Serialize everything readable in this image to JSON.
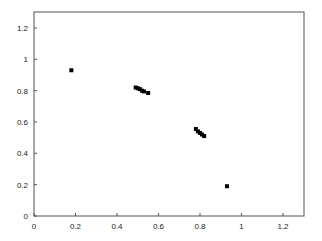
{
  "chart_data": {
    "type": "scatter",
    "title": "",
    "xlabel": "",
    "ylabel": "",
    "xlim": [
      0,
      1.3
    ],
    "ylim": [
      0,
      1.3
    ],
    "xticks": [
      0,
      0.2,
      0.4,
      0.6,
      0.8,
      1,
      1.2
    ],
    "yticks": [
      0,
      0.2,
      0.4,
      0.6,
      0.8,
      1,
      1.2
    ],
    "xtick_labels": [
      "0",
      "0.2",
      "0.4",
      "0.6",
      "0.8",
      "1",
      "1.2"
    ],
    "ytick_labels": [
      "0",
      "0.2",
      "0.4",
      "0.6",
      "0.8",
      "1",
      "1.2"
    ],
    "grid": false,
    "legend": null,
    "marker_color": "#000000",
    "series": [
      {
        "name": "points",
        "x": [
          0.18,
          0.49,
          0.5,
          0.51,
          0.52,
          0.53,
          0.55,
          0.78,
          0.79,
          0.8,
          0.81,
          0.82,
          0.93
        ],
        "y": [
          0.93,
          0.82,
          0.815,
          0.81,
          0.8,
          0.795,
          0.785,
          0.555,
          0.54,
          0.53,
          0.52,
          0.51,
          0.19
        ]
      }
    ]
  }
}
